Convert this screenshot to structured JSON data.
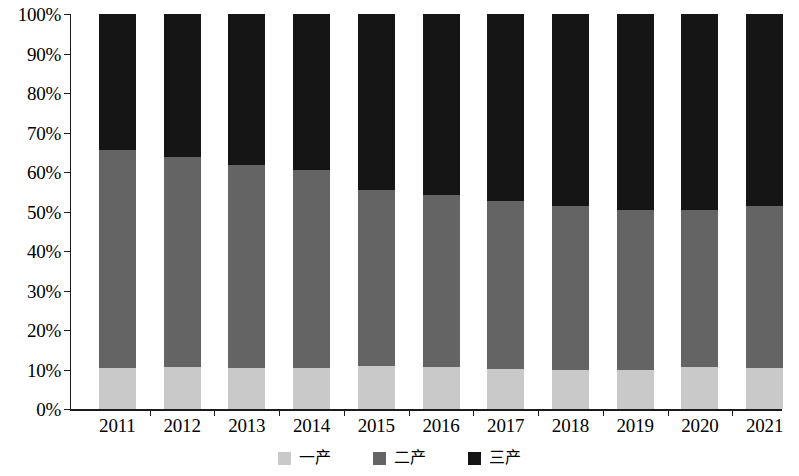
{
  "chart_data": {
    "type": "bar",
    "subtype": "stacked-percentage-column",
    "title": "",
    "subtitle": "",
    "xlabel": "",
    "ylabel": "",
    "ylim": [
      0,
      100
    ],
    "yunit": "%",
    "ytick_labels": [
      "0%",
      "10%",
      "20%",
      "30%",
      "40%",
      "50%",
      "60%",
      "70%",
      "80%",
      "90%",
      "100%"
    ],
    "ytick_values": [
      0,
      10,
      20,
      30,
      40,
      50,
      60,
      70,
      80,
      90,
      100
    ],
    "grid": false,
    "legend_position": "bottom-center",
    "categories": [
      "2011",
      "2012",
      "2013",
      "2014",
      "2015",
      "2016",
      "2017",
      "2018",
      "2019",
      "2020",
      "2021"
    ],
    "series": [
      {
        "name": "一产",
        "color": "#c9c9c9",
        "values": [
          10.4,
          10.7,
          10.4,
          10.4,
          10.8,
          10.6,
          10.1,
          10.0,
          9.8,
          10.6,
          10.3
        ]
      },
      {
        "name": "二产",
        "color": "#646464",
        "values": [
          55.2,
          53.1,
          51.4,
          50.2,
          44.7,
          43.6,
          42.6,
          41.4,
          40.6,
          39.9,
          41.0
        ]
      },
      {
        "name": "三产",
        "color": "#151515",
        "values": [
          34.4,
          36.2,
          38.2,
          39.4,
          44.5,
          45.8,
          47.3,
          48.6,
          49.6,
          49.5,
          48.7
        ]
      }
    ],
    "annotations": []
  },
  "legend": {
    "items": [
      {
        "label": "一产",
        "color": "#c9c9c9"
      },
      {
        "label": "二产",
        "color": "#646464"
      },
      {
        "label": "三产",
        "color": "#151515"
      }
    ]
  }
}
